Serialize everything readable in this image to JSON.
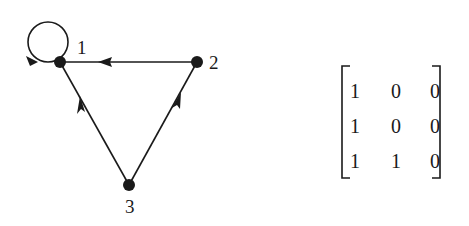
{
  "graph": {
    "nodes": [
      {
        "id": "1",
        "label": "1",
        "x": 60,
        "y": 62
      },
      {
        "id": "2",
        "label": "2",
        "x": 197,
        "y": 62
      },
      {
        "id": "3",
        "label": "3",
        "x": 129,
        "y": 185
      }
    ],
    "edges": [
      {
        "from": "1",
        "to": "1",
        "type": "self-loop"
      },
      {
        "from": "2",
        "to": "1"
      },
      {
        "from": "3",
        "to": "1"
      },
      {
        "from": "3",
        "to": "2"
      }
    ]
  },
  "matrix": {
    "rows": [
      [
        "1",
        "0",
        "0"
      ],
      [
        "1",
        "0",
        "0"
      ],
      [
        "1",
        "1",
        "0"
      ]
    ]
  },
  "colors": {
    "ink": "#1a1a1a",
    "background": "#ffffff"
  }
}
